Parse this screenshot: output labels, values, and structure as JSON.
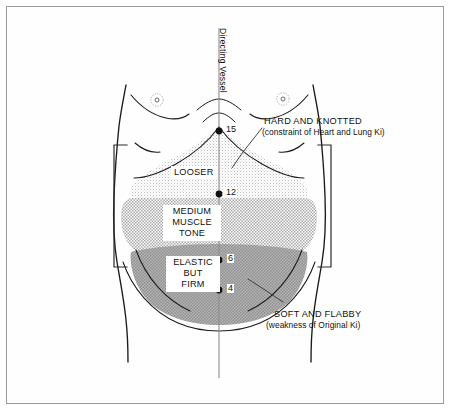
{
  "diagram": {
    "meridian_label": "Directing Vessel",
    "zones": [
      {
        "id": "looser",
        "label": "LOOSER",
        "tone": "light-stipple"
      },
      {
        "id": "medium",
        "label": "MEDIUM\nMUSCLE\nTONE",
        "label_lines": [
          "MEDIUM",
          "MUSCLE",
          "TONE"
        ],
        "tone": "medium-halftone"
      },
      {
        "id": "elastic",
        "label": "ELASTIC\nBUT\nFIRM",
        "label_lines": [
          "ELASTIC",
          "BUT",
          "FIRM"
        ],
        "tone": "dark-halftone"
      }
    ],
    "annotations": [
      {
        "id": "hard-knotted",
        "title": "HARD AND KNOTTED",
        "subtitle": "(constraint of Heart and Lung Ki)"
      },
      {
        "id": "soft-flabby",
        "title": "SOFT AND FLABBY",
        "subtitle": "(weakness of Original Ki)"
      }
    ],
    "points": [
      {
        "id": "dv15",
        "number": "15",
        "x": 219,
        "y": 131
      },
      {
        "id": "dv12",
        "number": "12",
        "x": 219,
        "y": 194
      },
      {
        "id": "dv8",
        "number": "",
        "x": 219,
        "y": 239
      },
      {
        "id": "dv6",
        "number": "6",
        "x": 219,
        "y": 260
      },
      {
        "id": "dv4",
        "number": "4",
        "x": 219,
        "y": 290
      }
    ],
    "colors": {
      "outline": "#1a1a1a",
      "frame": "#9a9a9a",
      "zone_light": "#ededed",
      "zone_medium": "#c9c9c9",
      "zone_dark": "#a8a8a8",
      "text": "#111111"
    }
  }
}
